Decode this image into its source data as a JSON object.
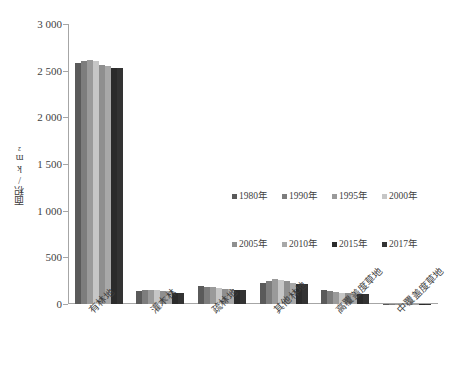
{
  "chart_data": {
    "type": "bar",
    "title": "",
    "xlabel": "",
    "ylabel": "面积/km²",
    "ylim": [
      0,
      3000
    ],
    "ytick_values": [
      0,
      500,
      1000,
      1500,
      2000,
      2500,
      3000
    ],
    "ytick_labels": [
      "0",
      "500",
      "1 000",
      "1 500",
      "2 000",
      "2 500",
      "3 000"
    ],
    "grid": false,
    "legend_position": "center-right",
    "categories": [
      "有林地",
      "灌木林",
      "疏林地",
      "其他林地",
      "高覆盖度草地",
      "中覆盖度草地"
    ],
    "series": [
      {
        "name": "1980年",
        "color": "#5a5a5a",
        "values": [
          2580,
          140,
          190,
          230,
          150,
          4
        ]
      },
      {
        "name": "1990年",
        "color": "#7d7d7d",
        "values": [
          2600,
          145,
          185,
          250,
          140,
          4
        ]
      },
      {
        "name": "1995年",
        "color": "#9a9a9a",
        "values": [
          2610,
          148,
          180,
          265,
          125,
          4
        ]
      },
      {
        "name": "2000年",
        "color": "#c6c6c6",
        "values": [
          2605,
          150,
          175,
          255,
          120,
          4
        ]
      },
      {
        "name": "2005年",
        "color": "#8f8f8f",
        "values": [
          2560,
          140,
          165,
          250,
          115,
          4
        ]
      },
      {
        "name": "2010年",
        "color": "#a8a8a8",
        "values": [
          2555,
          135,
          160,
          220,
          110,
          4
        ]
      },
      {
        "name": "2015年",
        "color": "#2b2b2b",
        "values": [
          2530,
          120,
          155,
          215,
          105,
          4
        ]
      },
      {
        "name": "2017年",
        "color": "#333333",
        "values": [
          2530,
          118,
          152,
          212,
          102,
          4
        ]
      }
    ]
  },
  "colors": {
    "axis": "#a6a6a6",
    "text": "#3f3f3f",
    "background": "#ffffff"
  }
}
